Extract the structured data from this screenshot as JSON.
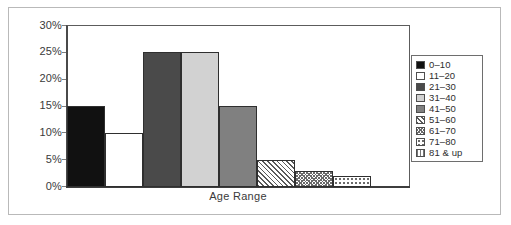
{
  "chart_data": {
    "type": "bar",
    "title": "",
    "xlabel": "Age Range",
    "ylabel": "",
    "categories": [
      "0–10",
      "11–20",
      "21–30",
      "31–40",
      "41–50",
      "51–60",
      "61–70",
      "71–80",
      "81 & up"
    ],
    "values": [
      15,
      10,
      25,
      25,
      15,
      5,
      3,
      2,
      0
    ],
    "value_suffix": "%",
    "ylim": [
      0,
      30
    ],
    "ytick_labels": [
      "30%",
      "25%",
      "20%",
      "15%",
      "10%",
      "5%",
      "0%"
    ],
    "ytick_values": [
      30,
      25,
      20,
      15,
      10,
      5,
      0
    ],
    "grid": false,
    "legend_position": "right",
    "legend_entries": [
      {
        "label": "0–10",
        "pattern": "solid",
        "color": "#111111"
      },
      {
        "label": "11–20",
        "pattern": "solid",
        "color": "#ffffff"
      },
      {
        "label": "21–30",
        "pattern": "solid",
        "color": "#4a4a4a"
      },
      {
        "label": "31–40",
        "pattern": "solid",
        "color": "#d2d2d2"
      },
      {
        "label": "41–50",
        "pattern": "solid",
        "color": "#808080"
      },
      {
        "label": "51–60",
        "pattern": "diagonal",
        "color": "#ffffff"
      },
      {
        "label": "61–70",
        "pattern": "crosshatch",
        "color": "#ffffff"
      },
      {
        "label": "71–80",
        "pattern": "dots",
        "color": "#ffffff"
      },
      {
        "label": "81 & up",
        "pattern": "vertical-lines",
        "color": "#ffffff"
      }
    ]
  },
  "colors": {
    "axis": "#3d3d3d",
    "frame": "#b9b9b9",
    "text": "#3a3a3a",
    "bar_outline": "#2f2f2f"
  }
}
